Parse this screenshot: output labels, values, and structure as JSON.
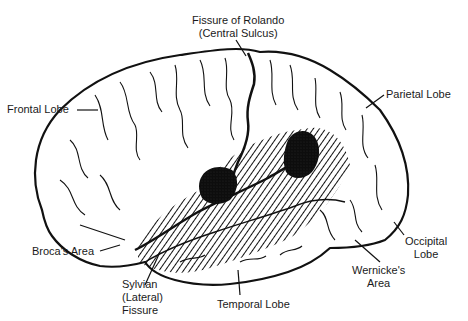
{
  "figure": {
    "colors": {
      "ink": "#111111",
      "background": "#ffffff",
      "hatch": "#111111",
      "stipple_area": "#0d0d0d"
    }
  },
  "labels": {
    "fissure_rolando_line1": "Fissure of Rolando",
    "fissure_rolando_line2": "(Central Sulcus)",
    "frontal_lobe": "Frontal Lobe",
    "parietal_lobe": "Parietal Lobe",
    "occipital_lobe_line1": "Occipital",
    "occipital_lobe_line2": "Lobe",
    "brocas_area": "Broca's Area",
    "sylvian_line1": "Sylvian",
    "sylvian_line2": "(Lateral)",
    "sylvian_line3": "Fissure",
    "temporal_lobe": "Temporal Lobe",
    "wernickes_line1": "Wernicke's",
    "wernickes_line2": "Area"
  }
}
